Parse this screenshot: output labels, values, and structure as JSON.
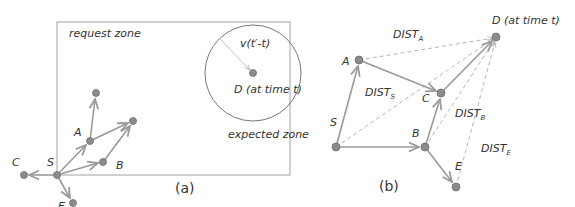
{
  "panel_a": {
    "caption": "(a)",
    "request_zone_label": "request zone",
    "expected_zone_label": "expected zone",
    "radius_label": "v(t′-t)",
    "dest_label": "D (at time t)",
    "nodes": {
      "S": "S",
      "A": "A",
      "B": "B",
      "C": "C",
      "E": "E"
    }
  },
  "panel_b": {
    "caption": "(b)",
    "dest_label": "D (at time t)",
    "nodes": {
      "S": "S",
      "A": "A",
      "B": "B",
      "C": "C",
      "E": "E"
    },
    "distances": {
      "A": {
        "base": "DIST",
        "sub": "A"
      },
      "S": {
        "base": "DIST",
        "sub": "S"
      },
      "B": {
        "base": "DIST",
        "sub": "B"
      },
      "E": {
        "base": "DIST",
        "sub": "E"
      }
    }
  },
  "colors": {
    "edge": "#9a9a9a",
    "node": "#8c8c8c",
    "node_stroke": "#6f6f6f",
    "dashed": "#b5b5b5",
    "frame": "#8a8a8a",
    "text": "#333333"
  }
}
